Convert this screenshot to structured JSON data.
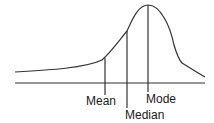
{
  "diagram": {
    "labels": {
      "mean": "Mean",
      "median": "Median",
      "mode": "Mode"
    },
    "colors": {
      "line": "#333333",
      "text": "#1a1a1a",
      "background": "#ffffff"
    }
  }
}
